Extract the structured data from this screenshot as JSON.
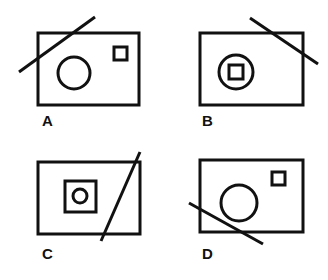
{
  "figure": {
    "background_color": "#ffffff",
    "ink_color": "#111111",
    "stroke_width": 3,
    "width": 328,
    "height": 280
  },
  "panels": [
    {
      "id": "A",
      "label": "A",
      "label_x": 42,
      "label_y": 126,
      "rect": {
        "x": 38,
        "y": 33,
        "w": 101,
        "h": 72
      },
      "shapes": [
        {
          "kind": "circle",
          "cx": 74,
          "cy": 73,
          "r": 16
        },
        {
          "kind": "square",
          "x": 114,
          "y": 47,
          "w": 13,
          "h": 13
        }
      ],
      "line": {
        "x1": 19,
        "y1": 72,
        "x2": 95,
        "y2": 17
      },
      "line_direction": "lower-left-to-upper-right",
      "description": "Rectangle with a large circle at left-center and a small square at upper right; diagonal line crosses the upper left corner."
    },
    {
      "id": "B",
      "label": "B",
      "label_x": 202,
      "label_y": 126,
      "rect": {
        "x": 200,
        "y": 33,
        "w": 103,
        "h": 72
      },
      "shapes": [
        {
          "kind": "circle",
          "cx": 236,
          "cy": 72,
          "r": 17
        },
        {
          "kind": "square",
          "x": 229,
          "y": 65,
          "w": 14,
          "h": 14
        }
      ],
      "line": {
        "x1": 250,
        "y1": 18,
        "x2": 318,
        "y2": 64
      },
      "line_direction": "upper-left-to-lower-right",
      "description": "Rectangle with a circle containing a small square at left-center; diagonal line crosses the upper right corner."
    },
    {
      "id": "C",
      "label": "C",
      "label_x": 42,
      "label_y": 259,
      "rect": {
        "x": 38,
        "y": 162,
        "w": 102,
        "h": 72
      },
      "shapes": [
        {
          "kind": "square",
          "x": 65,
          "y": 181,
          "w": 31,
          "h": 31
        },
        {
          "kind": "circle",
          "cx": 80,
          "cy": 196,
          "r": 7
        }
      ],
      "line": {
        "x1": 101,
        "y1": 241,
        "x2": 140,
        "y2": 152
      },
      "line_direction": "lower-left-to-upper-right",
      "description": "Rectangle with a square containing a small circle at left-center; steep diagonal line crosses the right portion."
    },
    {
      "id": "D",
      "label": "D",
      "label_x": 202,
      "label_y": 259,
      "rect": {
        "x": 200,
        "y": 160,
        "w": 103,
        "h": 72
      },
      "shapes": [
        {
          "kind": "circle",
          "cx": 239,
          "cy": 203,
          "r": 18
        },
        {
          "kind": "square",
          "x": 272,
          "y": 172,
          "w": 13,
          "h": 13
        }
      ],
      "line": {
        "x1": 189,
        "y1": 203,
        "x2": 263,
        "y2": 244
      },
      "line_direction": "upper-left-to-lower-right",
      "description": "Rectangle with a large circle at center and a small square at upper right; diagonal line crosses the lower left corner."
    }
  ]
}
